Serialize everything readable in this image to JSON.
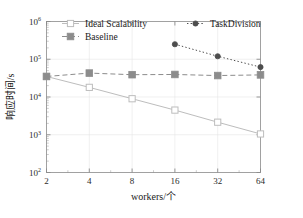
{
  "chart_data": {
    "type": "line",
    "title": "",
    "xlabel": "workers/个",
    "ylabel": "响应时间/s",
    "x": [
      2,
      4,
      8,
      16,
      32,
      64
    ],
    "xticklabels": [
      "2",
      "4",
      "8",
      "16",
      "32",
      "64"
    ],
    "xscale": "log2",
    "yscale": "log10",
    "ylim": [
      100,
      1000000
    ],
    "yticklabels": [
      "10²",
      "10³",
      "10⁴",
      "10⁵",
      "10⁶"
    ],
    "ytick_bases": [
      "10",
      "10",
      "10",
      "10",
      "10"
    ],
    "ytick_exponents": [
      "2",
      "3",
      "4",
      "5",
      "6"
    ],
    "grid": true,
    "legend_position": "upper-left-inside",
    "series": [
      {
        "name": "Ideal Scalability",
        "marker": "open-square",
        "linestyle": "solid",
        "color": "#bdbdbd",
        "x": [
          2,
          4,
          8,
          16,
          32,
          64
        ],
        "values": [
          35000,
          18000,
          9000,
          4500,
          2150,
          1050
        ]
      },
      {
        "name": "Baseline",
        "marker": "filled-square",
        "linestyle": "dashed",
        "color": "#8c8c8c",
        "x": [
          2,
          4,
          8,
          16,
          32,
          64
        ],
        "values": [
          35000,
          43000,
          39000,
          39500,
          37000,
          38500
        ]
      },
      {
        "name": "TaskDivision",
        "marker": "filled-circle",
        "linestyle": "dotted",
        "color": "#4d4d4d",
        "x": [
          16,
          32,
          64
        ],
        "values": [
          250000,
          120000,
          62000
        ]
      }
    ]
  },
  "legend": {
    "entries": [
      {
        "label": "Ideal Scalability"
      },
      {
        "label": "Baseline"
      },
      {
        "label": "TaskDivision"
      }
    ]
  },
  "axes": {
    "x_title": "workers/个",
    "y_title": "响应时间/s"
  }
}
